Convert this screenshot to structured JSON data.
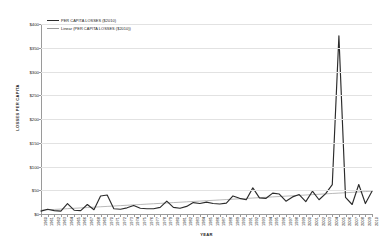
{
  "chart_data": {
    "type": "line",
    "title": "",
    "xlabel": "YEAR",
    "ylabel": "LOSSES PER CAPITA",
    "ylim": [
      0,
      400
    ],
    "ytick_values": [
      0,
      50,
      100,
      150,
      200,
      250,
      300,
      350,
      400
    ],
    "ytick_labels": [
      "$0",
      "$50",
      "$100",
      "$150",
      "$200",
      "$250",
      "$300",
      "$350",
      "$400"
    ],
    "grid": "horizontal",
    "legend_position": "top-left-inside",
    "x": [
      1960,
      1961,
      1962,
      1963,
      1964,
      1965,
      1966,
      1967,
      1968,
      1969,
      1970,
      1971,
      1972,
      1973,
      1974,
      1975,
      1976,
      1977,
      1978,
      1979,
      1980,
      1981,
      1982,
      1983,
      1984,
      1985,
      1986,
      1987,
      1988,
      1989,
      1990,
      1991,
      1992,
      1993,
      1994,
      1995,
      1996,
      1997,
      1998,
      1999,
      2000,
      2001,
      2002,
      2003,
      2004,
      2005,
      2006,
      2007,
      2008,
      2009,
      2010
    ],
    "categories": [
      "1960",
      "1961",
      "1962",
      "1963",
      "1964",
      "1965",
      "1966",
      "1967",
      "1968",
      "1969",
      "1970",
      "1971",
      "1972",
      "1973",
      "1974",
      "1975",
      "1976",
      "1977",
      "1978",
      "1979",
      "1980",
      "1981",
      "1982",
      "1983",
      "1984",
      "1985",
      "1986",
      "1987",
      "1988",
      "1989",
      "1990",
      "1991",
      "1992",
      "1993",
      "1994",
      "1995",
      "1996",
      "1997",
      "1998",
      "1999",
      "2000",
      "2001",
      "2002",
      "2003",
      "2004",
      "2005",
      "2006",
      "2007",
      "2008",
      "2009",
      "2010"
    ],
    "series": [
      {
        "name": "PER CAPITA LOSSES ($2010)",
        "kind": "data",
        "color": "#2b2b2b",
        "values": [
          6,
          10,
          7,
          6,
          22,
          8,
          7,
          20,
          9,
          38,
          40,
          11,
          10,
          13,
          18,
          12,
          11,
          11,
          14,
          27,
          14,
          12,
          16,
          24,
          22,
          25,
          22,
          21,
          23,
          38,
          33,
          30,
          55,
          34,
          33,
          44,
          42,
          27,
          36,
          41,
          26,
          48,
          30,
          43,
          62,
          375,
          35,
          20,
          62,
          22,
          48
        ]
      },
      {
        "name": "Linear (PER CAPITA LOSSES ($2010))",
        "kind": "trend",
        "color": "#9b9b9b",
        "values": [
          8.0,
          8.8,
          9.6,
          10.4,
          11.2,
          12.0,
          12.8,
          13.6,
          14.4,
          15.2,
          16.0,
          16.8,
          17.6,
          18.4,
          19.2,
          20.0,
          20.8,
          21.6,
          22.4,
          23.2,
          24.0,
          24.8,
          25.6,
          26.4,
          27.2,
          28.0,
          28.8,
          29.6,
          30.4,
          31.2,
          32.0,
          32.8,
          33.6,
          34.4,
          35.2,
          36.0,
          36.8,
          37.6,
          38.4,
          39.2,
          40.0,
          40.8,
          41.6,
          42.4,
          43.2,
          44.0,
          44.8,
          45.6,
          46.4,
          47.2,
          48.0
        ]
      }
    ],
    "legend": [
      "PER CAPITA LOSSES ($2010)",
      "Linear (PER CAPITA LOSSES ($2010))"
    ]
  },
  "colors": {
    "background": "#ffffff",
    "data_line": "#2b2b2b",
    "trend_line": "#9b9b9b",
    "gridline": "#e2e2e2",
    "axis": "#9a9a9a",
    "text": "#1a1a1a"
  }
}
